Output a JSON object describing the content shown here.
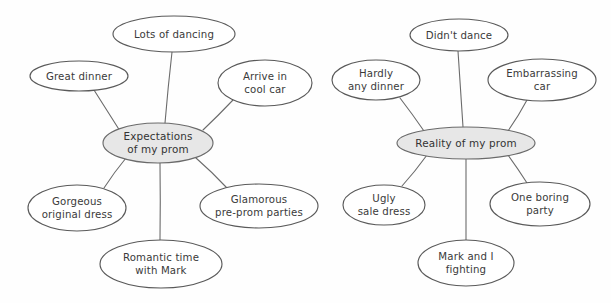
{
  "diagram": {
    "type": "double-bubble-mind-map",
    "background_color": "#fefefe",
    "central_fill_color": "#e7e7e7",
    "node_fill_color": "#ffffff",
    "stroke_color": "#5a5a5a",
    "text_color": "#3a3a3a",
    "clusters": [
      {
        "id": "expectations",
        "center": {
          "label_line1": "Expectations",
          "label_line2": "of my prom",
          "cx": 158,
          "cy": 143,
          "rx": 55,
          "ry": 20
        },
        "nodes": [
          {
            "id": "lots-of-dancing",
            "label_line1": "Lots of dancing",
            "label_line2": "",
            "cx": 174,
            "cy": 34,
            "rx": 61,
            "ry": 18
          },
          {
            "id": "great-dinner",
            "label_line1": "Great dinner",
            "label_line2": "",
            "cx": 79,
            "cy": 76,
            "rx": 49,
            "ry": 15
          },
          {
            "id": "arrive-in-cool-car",
            "label_line1": "Arrive in",
            "label_line2": "cool car",
            "cx": 265,
            "cy": 83,
            "rx": 47,
            "ry": 23
          },
          {
            "id": "gorgeous-original-dress",
            "label_line1": "Gorgeous",
            "label_line2": "original dress",
            "cx": 77,
            "cy": 208,
            "rx": 49,
            "ry": 23
          },
          {
            "id": "glamorous-pre-prom-parties",
            "label_line1": "Glamorous",
            "label_line2": "pre-prom parties",
            "cx": 259,
            "cy": 206,
            "rx": 59,
            "ry": 22
          },
          {
            "id": "romantic-time-with-mark",
            "label_line1": "Romantic time",
            "label_line2": "with Mark",
            "cx": 161,
            "cy": 264,
            "rx": 61,
            "ry": 24
          }
        ]
      },
      {
        "id": "reality",
        "center": {
          "label_line1": "Reality of my prom",
          "label_line2": "",
          "cx": 466,
          "cy": 143,
          "rx": 69,
          "ry": 16
        },
        "nodes": [
          {
            "id": "didnt-dance",
            "label_line1": "Didn't dance",
            "label_line2": "",
            "cx": 459,
            "cy": 35,
            "rx": 49,
            "ry": 16
          },
          {
            "id": "hardly-any-dinner",
            "label_line1": "Hardly",
            "label_line2": "any dinner",
            "cx": 376,
            "cy": 80,
            "rx": 44,
            "ry": 20
          },
          {
            "id": "embarrassing-car",
            "label_line1": "Embarrassing",
            "label_line2": "car",
            "cx": 542,
            "cy": 80,
            "rx": 54,
            "ry": 21
          },
          {
            "id": "ugly-sale-dress",
            "label_line1": "Ugly",
            "label_line2": "sale dress",
            "cx": 384,
            "cy": 205,
            "rx": 41,
            "ry": 20
          },
          {
            "id": "one-boring-party",
            "label_line1": "One boring",
            "label_line2": "party",
            "cx": 540,
            "cy": 204,
            "rx": 50,
            "ry": 22
          },
          {
            "id": "mark-and-i-fighting",
            "label_line1": "Mark and I",
            "label_line2": "fighting",
            "cx": 466,
            "cy": 263,
            "rx": 48,
            "ry": 23
          }
        ]
      }
    ],
    "edges": [
      {
        "id": "edge-expectations-lots-of-dancing",
        "x1": 165,
        "y1": 123,
        "x2": 172,
        "y2": 52
      },
      {
        "id": "edge-expectations-great-dinner",
        "x1": 120,
        "y1": 131,
        "x2": 94,
        "y2": 90
      },
      {
        "id": "edge-expectations-arrive-in-cool-car",
        "x1": 203,
        "y1": 130,
        "x2": 233,
        "y2": 100
      },
      {
        "id": "edge-expectations-gorgeous-original-dress",
        "x1": 126,
        "y1": 158,
        "x2": 104,
        "y2": 188
      },
      {
        "id": "edge-expectations-glamorous-pre-prom-parties",
        "x1": 196,
        "y1": 158,
        "x2": 227,
        "y2": 188
      },
      {
        "id": "edge-expectations-romantic-time-with-mark",
        "x1": 160,
        "y1": 163,
        "x2": 160,
        "y2": 240
      },
      {
        "id": "edge-reality-didnt-dance",
        "x1": 463,
        "y1": 127,
        "x2": 458,
        "y2": 51
      },
      {
        "id": "edge-reality-hardly-any-dinner",
        "x1": 424,
        "y1": 131,
        "x2": 400,
        "y2": 98
      },
      {
        "id": "edge-reality-embarrassing-car",
        "x1": 508,
        "y1": 131,
        "x2": 527,
        "y2": 100
      },
      {
        "id": "edge-reality-ugly-sale-dress",
        "x1": 427,
        "y1": 155,
        "x2": 402,
        "y2": 186
      },
      {
        "id": "edge-reality-one-boring-party",
        "x1": 508,
        "y1": 155,
        "x2": 527,
        "y2": 183
      },
      {
        "id": "edge-reality-mark-and-i-fighting",
        "x1": 466,
        "y1": 159,
        "x2": 466,
        "y2": 240
      }
    ]
  }
}
